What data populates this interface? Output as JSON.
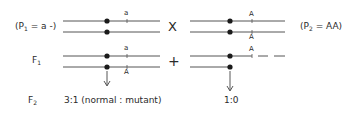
{
  "p1": {
    "label_prefix": "(P",
    "label_sub": "1",
    "label_suffix": " = a -)",
    "allele_top": "a"
  },
  "p2": {
    "label_prefix": "(P",
    "label_sub": "2",
    "label_suffix": " = AA)",
    "allele_top": "A",
    "allele_bottom": "A"
  },
  "cross_symbol": "X",
  "f1": {
    "label_prefix": "F",
    "label_sub": "1",
    "left_allele_top": "a",
    "left_allele_bottom": "A",
    "right_allele_top": "A"
  },
  "plus_symbol": "+",
  "f2": {
    "label_prefix": "F",
    "label_sub": "2",
    "left_ratio": "3:1 (normal : mutant)",
    "right_ratio": "1:0"
  },
  "colors": {
    "ink": "#2a2a2a",
    "line": "#555555",
    "background": "#ffffff"
  }
}
